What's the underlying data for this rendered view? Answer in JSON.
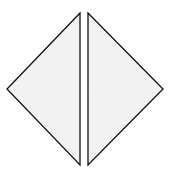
{
  "diagram": {
    "colors": {
      "background": "#ffffff",
      "fill": "#f2f2f2",
      "stroke": "#111111"
    },
    "stroke_width": 1.3,
    "shapes": [
      {
        "name": "left-triangle",
        "points": "80,13 7,89 80,165"
      },
      {
        "name": "right-triangle",
        "points": "88,13 163,89 88,165"
      }
    ]
  }
}
